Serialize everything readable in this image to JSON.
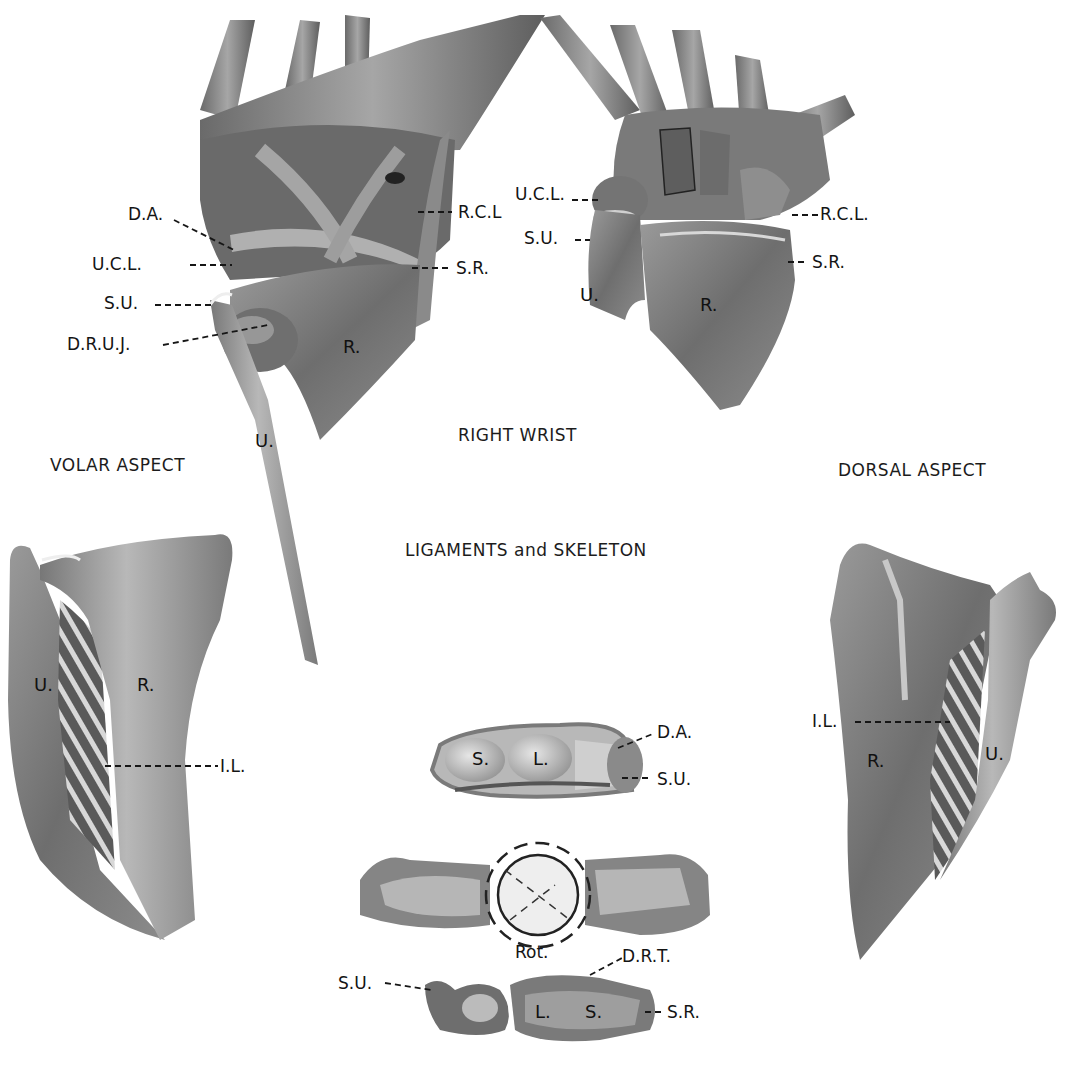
{
  "plate": {
    "title": "RIGHT WRIST",
    "subtitle": "LIGAMENTS and SKELETON",
    "left_aspect": "VOLAR ASPECT",
    "right_aspect": "DORSAL ASPECT"
  },
  "figures": {
    "volar_wrist": {
      "callouts": [
        "D.A.",
        "U.C.L.",
        "S.U.",
        "D.R.U.J.",
        "R.C.L",
        "S.R."
      ],
      "bones": [
        "R.",
        "U."
      ]
    },
    "dorsal_wrist": {
      "callouts": [
        "U.C.L.",
        "S.U.",
        "R.C.L.",
        "S.R."
      ],
      "bones": [
        "U.",
        "R."
      ]
    },
    "volar_forearm": {
      "bones": [
        "U.",
        "R."
      ],
      "callouts": [
        "I.L."
      ]
    },
    "dorsal_forearm": {
      "bones": [
        "R.",
        "U."
      ],
      "callouts": [
        "I.L."
      ]
    },
    "carpal_section": {
      "bones": [
        "S.",
        "L."
      ],
      "callouts": [
        "D.A.",
        "S.U."
      ]
    },
    "rotation_view": {
      "callouts": [
        "Rot.",
        "D.R.T.",
        "S.U.",
        "S.R."
      ],
      "bones": [
        "L.",
        "S."
      ]
    }
  },
  "palette": {
    "bone_dark": "#5a5a5a",
    "bone_mid": "#8a8a8a",
    "bone_light": "#c9c9c9",
    "ink": "#141414",
    "paper": "#ffffff"
  }
}
